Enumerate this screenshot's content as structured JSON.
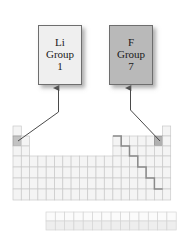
{
  "diagram": {
    "background": "#ffffff"
  },
  "callouts": [
    {
      "id": "li",
      "symbol": "Li",
      "group_label": "Group",
      "group_number": "1",
      "fill": "#efefef",
      "border": "#6e6e6e",
      "points_to": "group-1-period-2-cell"
    },
    {
      "id": "f",
      "symbol": "F",
      "group_label": "Group",
      "group_number": "7",
      "fill": "#b9b9b9",
      "border": "#6e6e6e",
      "points_to": "group-17-period-2-cell"
    }
  ],
  "table": {
    "columns": 18,
    "rows": 7,
    "cell_fill": "#f4f4f4",
    "cell_stroke": "#c9c9c9",
    "highlight_fill_li": "#c3c3c3",
    "highlight_fill_f": "#b0b0b0",
    "staircase_stroke": "#8a8a8a",
    "fblock_rows": 2,
    "fblock_columns": 14,
    "highlighted_cells": [
      "Li",
      "F"
    ],
    "staircase_label": "metalloid dividing line"
  },
  "arrows": {
    "stroke": "#4a4a4a",
    "count": 2
  }
}
